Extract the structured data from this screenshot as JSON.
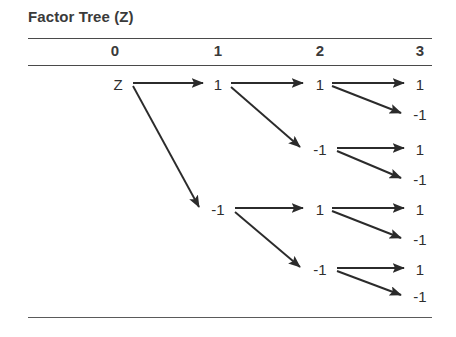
{
  "title": "Factor Tree (Z)",
  "columns": [
    {
      "label": "0",
      "x": 115
    },
    {
      "label": "1",
      "x": 218
    },
    {
      "label": "2",
      "x": 320
    },
    {
      "label": "3",
      "x": 420
    }
  ],
  "rules": [
    {
      "name": "rule-under-title",
      "y": 38
    },
    {
      "name": "rule-under-columns",
      "y": 65
    },
    {
      "name": "rule-bottom",
      "y": 317
    }
  ],
  "nodes": [
    {
      "id": "n0",
      "label": "Z",
      "depth": 0,
      "x": 118,
      "y": 85
    },
    {
      "id": "n1",
      "label": "1",
      "depth": 1,
      "x": 218,
      "y": 85
    },
    {
      "id": "n2",
      "label": "-1",
      "depth": 1,
      "x": 218,
      "y": 210
    },
    {
      "id": "n1a",
      "label": "1",
      "depth": 2,
      "x": 320,
      "y": 85
    },
    {
      "id": "n1b",
      "label": "-1",
      "depth": 2,
      "x": 320,
      "y": 150
    },
    {
      "id": "n2a",
      "label": "1",
      "depth": 2,
      "x": 320,
      "y": 210
    },
    {
      "id": "n2b",
      "label": "-1",
      "depth": 2,
      "x": 320,
      "y": 270
    },
    {
      "id": "n1a1",
      "label": "1",
      "depth": 3,
      "x": 420,
      "y": 85
    },
    {
      "id": "n1a2",
      "label": "-1",
      "depth": 3,
      "x": 420,
      "y": 115
    },
    {
      "id": "n1b1",
      "label": "1",
      "depth": 3,
      "x": 420,
      "y": 150
    },
    {
      "id": "n1b2",
      "label": "-1",
      "depth": 3,
      "x": 420,
      "y": 180
    },
    {
      "id": "n2a1",
      "label": "1",
      "depth": 3,
      "x": 420,
      "y": 210
    },
    {
      "id": "n2a2",
      "label": "-1",
      "depth": 3,
      "x": 420,
      "y": 240
    },
    {
      "id": "n2b1",
      "label": "1",
      "depth": 3,
      "x": 420,
      "y": 270
    },
    {
      "id": "n2b2",
      "label": "-1",
      "depth": 3,
      "x": 420,
      "y": 297
    }
  ],
  "edges": [
    {
      "from": "n0",
      "to": "n1",
      "x1": 133,
      "y1": 83,
      "x2": 203,
      "y2": 83
    },
    {
      "from": "n0",
      "to": "n2",
      "x1": 133,
      "y1": 86,
      "x2": 199,
      "y2": 207
    },
    {
      "from": "n1",
      "to": "n1a",
      "x1": 231,
      "y1": 83,
      "x2": 303,
      "y2": 83
    },
    {
      "from": "n1",
      "to": "n1b",
      "x1": 231,
      "y1": 87,
      "x2": 300,
      "y2": 147
    },
    {
      "from": "n2",
      "to": "n2a",
      "x1": 235,
      "y1": 208,
      "x2": 303,
      "y2": 208
    },
    {
      "from": "n2",
      "to": "n2b",
      "x1": 235,
      "y1": 212,
      "x2": 300,
      "y2": 267
    },
    {
      "from": "n1a",
      "to": "n1a1",
      "x1": 332,
      "y1": 83,
      "x2": 404,
      "y2": 83
    },
    {
      "from": "n1a",
      "to": "n1a2",
      "x1": 332,
      "y1": 86,
      "x2": 401,
      "y2": 113
    },
    {
      "from": "n1b",
      "to": "n1b1",
      "x1": 337,
      "y1": 148,
      "x2": 404,
      "y2": 148
    },
    {
      "from": "n1b",
      "to": "n1b2",
      "x1": 337,
      "y1": 151,
      "x2": 401,
      "y2": 178
    },
    {
      "from": "n2a",
      "to": "n2a1",
      "x1": 332,
      "y1": 208,
      "x2": 404,
      "y2": 208
    },
    {
      "from": "n2a",
      "to": "n2a2",
      "x1": 332,
      "y1": 211,
      "x2": 401,
      "y2": 238
    },
    {
      "from": "n2b",
      "to": "n2b1",
      "x1": 337,
      "y1": 268,
      "x2": 404,
      "y2": 268
    },
    {
      "from": "n2b",
      "to": "n2b2",
      "x1": 337,
      "y1": 271,
      "x2": 401,
      "y2": 295
    }
  ],
  "colors": {
    "text": "#3a3a3a",
    "node_text": "#2e2e2e",
    "rule": "#4a4a4a",
    "edge": "#2b2b2b",
    "background": "#ffffff"
  }
}
